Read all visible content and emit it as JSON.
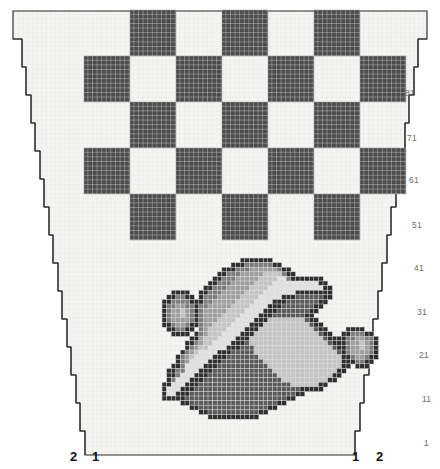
{
  "document": {
    "type": "cross-stitch-pattern-chart",
    "title": "Vintage Car Cross-Stitch Pattern Chart"
  },
  "canvas": {
    "width": 440,
    "height": 469,
    "background_color": "#ffffff"
  },
  "colors": {
    "page_background": "#ffffff",
    "cloth_background": "#f4f4f2",
    "grid_line": "#e6e6e2",
    "outline": "#2a2a2a",
    "dark_square": "#4c4c4c",
    "dark_square_grid": "#d8d8d8",
    "light_square": "#f7f7f5",
    "row_label": "#6d6d6d",
    "col_label": "#111111"
  },
  "cloth": {
    "stitch_size": 4.6,
    "shape": "trapezoid-stepped",
    "description": "Stepped staircase outline narrowing toward the bottom, drawn as two nested outlines"
  },
  "checkerboard": {
    "description": "Checkerboard border band of alternating dark and light squares",
    "cell_size": 46,
    "origin_x": 84,
    "origin_y": 10,
    "columns": 7,
    "rows": 5,
    "dark_color": "#4c4c4c",
    "light_color": "#f7f7f5",
    "pattern": [
      [
        0,
        1,
        0,
        1,
        0,
        1,
        0
      ],
      [
        1,
        0,
        1,
        0,
        1,
        0,
        1
      ],
      [
        0,
        1,
        0,
        1,
        0,
        1,
        0
      ],
      [
        1,
        0,
        1,
        0,
        1,
        0,
        1
      ],
      [
        0,
        1,
        0,
        1,
        0,
        1,
        0
      ]
    ]
  },
  "row_labels": {
    "values": [
      "81",
      "71",
      "61",
      "51",
      "41",
      "31",
      "21",
      "11",
      "1"
    ],
    "y_positions": [
      94,
      139,
      181,
      226,
      269,
      313,
      356,
      400,
      444
    ],
    "x_positions": [
      405,
      407,
      409,
      412,
      414,
      417,
      419,
      422,
      424
    ]
  },
  "column_labels": {
    "left": [
      {
        "text": "2",
        "x": 70,
        "y": 457,
        "bold": true
      },
      {
        "text": "1",
        "x": 92,
        "y": 457,
        "bold": true
      }
    ],
    "right": [
      {
        "text": "1",
        "x": 352,
        "y": 457,
        "bold": true
      },
      {
        "text": "2",
        "x": 376,
        "y": 457,
        "bold": true
      }
    ]
  },
  "motif": {
    "name": "vintage-racing-car",
    "description": "Pixelated vintage open-wheel car sprite rendered in grayscale stitches",
    "origin_x": 162,
    "origin_y": 258,
    "stitch": 4.6,
    "palette": {
      "0": "none",
      "1": "#2f2f2f",
      "2": "#5a5a5a",
      "3": "#7d7d7d",
      "4": "#9e9e9e",
      "5": "#c4c4c4",
      "6": "#e2e2e2"
    },
    "grid": [
      "00000000000000000111111100000000000000000000000",
      "00000000000000011133333311000000000000000000000",
      "00000000000001113334444443110000000000000000000",
      "00000000000011333444445555311000000000000000000",
      "00000000000113334444455556631111111000000000000",
      "00000000001133344444555566666666661100000000000",
      "00000000011333444445555666666666666110000000000",
      "00111100113334444455556666666111111110000000000",
      "01133110133344444555566666111222222110000000000",
      "11333311133444445555666611122222221100000000000",
      "13344331334444455556666111222222211000000000000",
      "13445431344444555566661112222222110000000000000",
      "13445431344445555666611122222221100000000000000",
      "13444431344455556666111555555552110000000000000",
      "11344311344555566661115555555555211000000000000",
      "01133110345555666611155555555555521100001111000",
      "00111101345556666111555555555555552110011333110",
      "00000011455566661115555555555555555211113344331",
      "00000113455666611125555555555555555521113445431",
      "00000134556666111222555555555555555552113445431",
      "00001345666611122222555555555555555555213444431",
      "00013456666111222222255555555555555555511344311",
      "00013466661112222222225555555555555555511133110",
      "00113666611122222222222555555555555555511011100",
      "01133666111222222222222255555555555555110000000",
      "01136661112222222222222225555555555551100000000",
      "01366611122222222222222222555555555511000000000",
      "11666111222222222222222222225555551100000000000",
      "16661112222222222222222222222211111000000000000",
      "16611122222222222222222222222110000000000000000",
      "11111222222222222222222222211000000000000000000",
      "00001122222222222222222221100000000000000000000",
      "00000011222222222222222110000000000000000000000",
      "00000000112222222222211000000000000000000000000",
      "00000000001111111111100000000000000000000000000"
    ]
  }
}
